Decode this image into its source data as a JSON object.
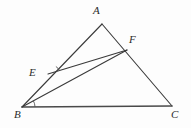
{
  "figure": {
    "background_color": "#fdfdfd",
    "stroke_color": "#3a3a3a",
    "label_color": "#2b2b2b",
    "width": 191,
    "height": 128
  },
  "points": {
    "A": {
      "label": "A",
      "x": 102,
      "y": 24,
      "label_x": 93,
      "label_y": 5
    },
    "B": {
      "label": "B",
      "x": 22,
      "y": 107,
      "label_x": 14,
      "label_y": 109
    },
    "C": {
      "label": "C",
      "x": 172,
      "y": 106,
      "label_x": 171,
      "label_y": 109
    },
    "E": {
      "label": "E",
      "x": 48,
      "y": 74,
      "label_x": 29,
      "label_y": 67
    },
    "F": {
      "label": "F",
      "x": 127,
      "y": 50,
      "label_x": 129,
      "label_y": 34
    }
  },
  "segments": [
    {
      "name": "side-AB",
      "from": "A",
      "to": "B"
    },
    {
      "name": "side-AC",
      "from": "A",
      "to": "C"
    },
    {
      "name": "side-BC",
      "from": "B",
      "to": "C"
    },
    {
      "name": "segment-EF",
      "from": "E",
      "to": "F"
    },
    {
      "name": "segment-BF",
      "from": "B",
      "to": "F"
    }
  ],
  "angle_marks": [
    {
      "name": "angle-mark-at-B",
      "vertex": "B",
      "radius": 13
    },
    {
      "name": "angle-mark-at-E",
      "vertex": "E",
      "radius": 12
    }
  ]
}
